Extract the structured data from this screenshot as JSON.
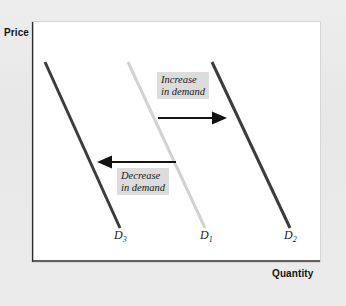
{
  "figure": {
    "background_color": "#e9e9e9",
    "panel_color": "#ffffff"
  },
  "axes": {
    "y_label": "Price",
    "x_label": "Quantity",
    "axis_color": "#2b2b2b"
  },
  "annotations": [
    {
      "id": "increase",
      "line1": "Increase",
      "line2": "in demand",
      "arrow_direction": "right",
      "box_color": "#dcdcdc"
    },
    {
      "id": "decrease",
      "line1": "Decrease",
      "line2": "in demand",
      "arrow_direction": "left",
      "box_color": "#dcdcdc"
    }
  ],
  "curve_labels": {
    "d3": "D",
    "d3_sub": "3",
    "d1": "D",
    "d1_sub": "1",
    "d2": "D",
    "d2_sub": "2"
  },
  "chart_data": {
    "type": "line",
    "title": "",
    "xlabel": "Quantity",
    "ylabel": "Price",
    "grid": false,
    "legend_position": "none",
    "axis_ticks": {
      "x": [],
      "y": []
    },
    "xlim": [
      0,
      288
    ],
    "ylim": [
      0,
      240
    ],
    "series": [
      {
        "name": "D3",
        "label": "D₃",
        "color": "#3c3c3c",
        "width": 3,
        "x": [
          13,
          88
        ],
        "y": [
          40,
          206
        ],
        "description": "Demand curve shifted left - decrease in demand"
      },
      {
        "name": "D1",
        "label": "D₁",
        "color": "#d2d2d2",
        "width": 3,
        "x": [
          96,
          173
        ],
        "y": [
          40,
          206
        ],
        "description": "Original demand curve"
      },
      {
        "name": "D2",
        "label": "D₂",
        "color": "#3c3c3c",
        "width": 3,
        "x": [
          180,
          258
        ],
        "y": [
          40,
          206
        ],
        "description": "Demand curve shifted right - increase in demand"
      }
    ],
    "arrows": [
      {
        "name": "increase-in-demand-arrow",
        "direction": "right",
        "x_start": 126,
        "x_end": 197,
        "y": 96,
        "color": "#111111"
      },
      {
        "name": "decrease-in-demand-arrow",
        "direction": "left",
        "x_start": 144,
        "x_end": 63,
        "y": 140,
        "color": "#111111"
      }
    ]
  }
}
